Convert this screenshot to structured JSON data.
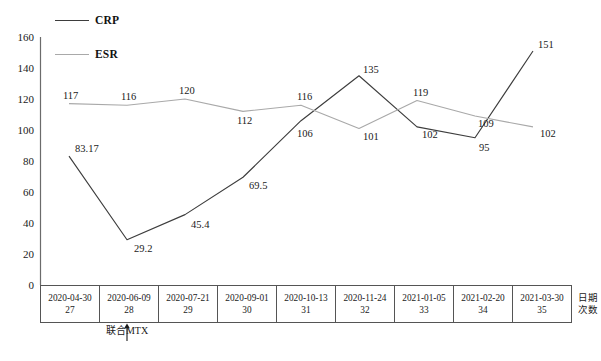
{
  "chart_data": {
    "type": "line",
    "title": "",
    "xlabel_rows": [
      "日期",
      "次数"
    ],
    "ylabel": "",
    "ylim": [
      0,
      160
    ],
    "ytick_step": 20,
    "yticks": [
      0,
      20,
      40,
      60,
      80,
      100,
      120,
      140,
      160
    ],
    "grid": false,
    "legend_position": "top-left",
    "categories": [
      "2020-04-30",
      "2020-06-09",
      "2020-07-21",
      "2020-09-01",
      "2020-10-13",
      "2020-11-24",
      "2021-01-05",
      "2021-02-20",
      "2021-03-30"
    ],
    "counts": [
      "27",
      "28",
      "29",
      "30",
      "31",
      "32",
      "33",
      "34",
      "35"
    ],
    "series": [
      {
        "name": "CRP",
        "color": "#3d3d3d",
        "values": [
          83.17,
          29.2,
          45.4,
          69.5,
          106,
          135,
          102,
          95,
          151
        ],
        "labels": [
          "83.17",
          "29.2",
          "45.4",
          "69.5",
          "106",
          "135",
          "102",
          "95",
          "151"
        ]
      },
      {
        "name": "ESR",
        "color": "#a9a9a9",
        "values": [
          117,
          116,
          120,
          112,
          116,
          101,
          119,
          109,
          102
        ],
        "labels": [
          "117",
          "116",
          "120",
          "112",
          "116",
          "101",
          "119",
          "109",
          "102"
        ]
      }
    ],
    "annotations": [
      {
        "text": "联合MTX",
        "target_category": "2020-06-09",
        "marker": "up-arrow"
      }
    ]
  },
  "legend": {
    "items": [
      {
        "label": "CRP",
        "color": "#3d3d3d"
      },
      {
        "label": "ESR",
        "color": "#a9a9a9"
      }
    ]
  },
  "axis": {
    "y_ticks": [
      "160",
      "140",
      "120",
      "100",
      "80",
      "60",
      "40",
      "20",
      "0"
    ],
    "corner_row1": "日期",
    "corner_row2": "次数"
  }
}
